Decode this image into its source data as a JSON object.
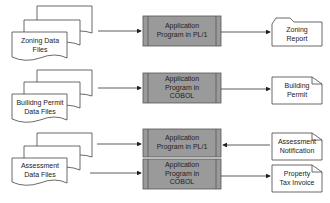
{
  "diagram": {
    "rows": [
      {
        "input": "Zoning Data Files",
        "input_lines": [
          "Zoning Data",
          "Files"
        ],
        "program_lines": [
          "Application",
          "Program in PL/1"
        ],
        "output_lines": [
          "Zoning",
          "Report"
        ],
        "flow": "input->program->output"
      },
      {
        "input": "Builidng Permit Data Files",
        "input_lines": [
          "Builidng Permit",
          "Data Files"
        ],
        "program_lines": [
          "Application",
          "Program in",
          "COBOL"
        ],
        "output_lines": [
          "Building",
          "Permit"
        ],
        "flow": "input->program->output"
      },
      {
        "input": "Assessment Data Files",
        "input_lines": [
          "Assessment",
          "Data Files"
        ],
        "program_lines": [
          "Application",
          "Program in PL/1"
        ],
        "output_lines": [
          "Assessment",
          "Notification"
        ],
        "flow": "input->program<-output"
      },
      {
        "program_lines": [
          "Application",
          "Program in",
          "COBOL"
        ],
        "output_lines": [
          "Property",
          "Tax Invoice"
        ],
        "flow": "input->program->output"
      }
    ],
    "colors": {
      "program_fill": "#9a9a9a",
      "program_border": "#555555",
      "doc_fill": "#ffffff",
      "line": "#333333"
    }
  }
}
